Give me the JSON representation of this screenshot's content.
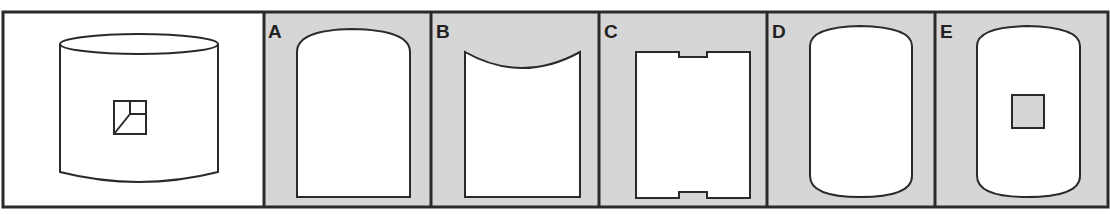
{
  "puzzle": {
    "question_panel": {
      "description": "cylinder with square window showing a small cube-corner drawing"
    },
    "options": [
      {
        "label": "A",
        "description": "flat net, convex arched top, flat bottom"
      },
      {
        "label": "B",
        "description": "flat net, concave top, flat bottom"
      },
      {
        "label": "C",
        "description": "rectangle with rectangular notches at top and bottom center"
      },
      {
        "label": "D",
        "description": "cylinder net, convex top and bottom"
      },
      {
        "label": "E",
        "description": "cylinder net, convex top and bottom, with gray square in center"
      }
    ]
  },
  "colors": {
    "frame": "#2a2a2a",
    "option_bg": "#d6d6d6",
    "shape_fill": "#ffffff",
    "stroke": "#2a2a2a"
  }
}
